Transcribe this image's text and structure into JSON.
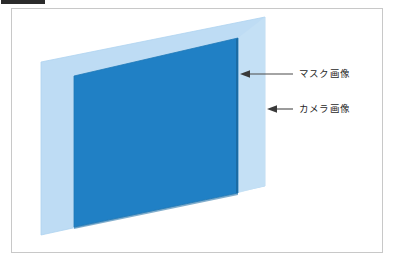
{
  "figure": {
    "type": "diagram",
    "title": "",
    "background_color": "#ffffff",
    "frame_border_color": "#c8c8c8",
    "top_strip_color": "#2b2b2b"
  },
  "planes": [
    {
      "id": "camera-image-plane",
      "label": "カメラ画像",
      "role": "back plane",
      "fill_color": "#bedcf4",
      "edge_color": "#a9cfee",
      "polygon": "41,62 265,17 265,186 41,235"
    },
    {
      "id": "mask-image-plane",
      "label": "マスク画像",
      "role": "front plane",
      "fill_color": "#2080c5",
      "edge_color": "#1a6da9",
      "polygon": "74,76 238,38 238,193 74,227"
    }
  ],
  "annotations": [
    {
      "id": "mask-callout",
      "label": "マスク画像",
      "arrow_direction": "left",
      "arrow_tip": {
        "x": 240,
        "y": 74
      },
      "arrow_tail": {
        "x": 293,
        "y": 74
      },
      "label_x": 299,
      "label_y": 68,
      "color": "#4a4a4a"
    },
    {
      "id": "camera-callout",
      "label": "カメラ画像",
      "arrow_direction": "left",
      "arrow_tip": {
        "x": 267,
        "y": 109
      },
      "arrow_tail": {
        "x": 293,
        "y": 109
      },
      "label_x": 299,
      "label_y": 103,
      "color": "#4a4a4a"
    }
  ],
  "colors": {
    "dark_blue": "#2080c5",
    "light_blue": "#bedcf4",
    "arrow_gray": "#4a4a4a",
    "text_black": "#1f1f1f",
    "frame_gray": "#c8c8c8"
  }
}
